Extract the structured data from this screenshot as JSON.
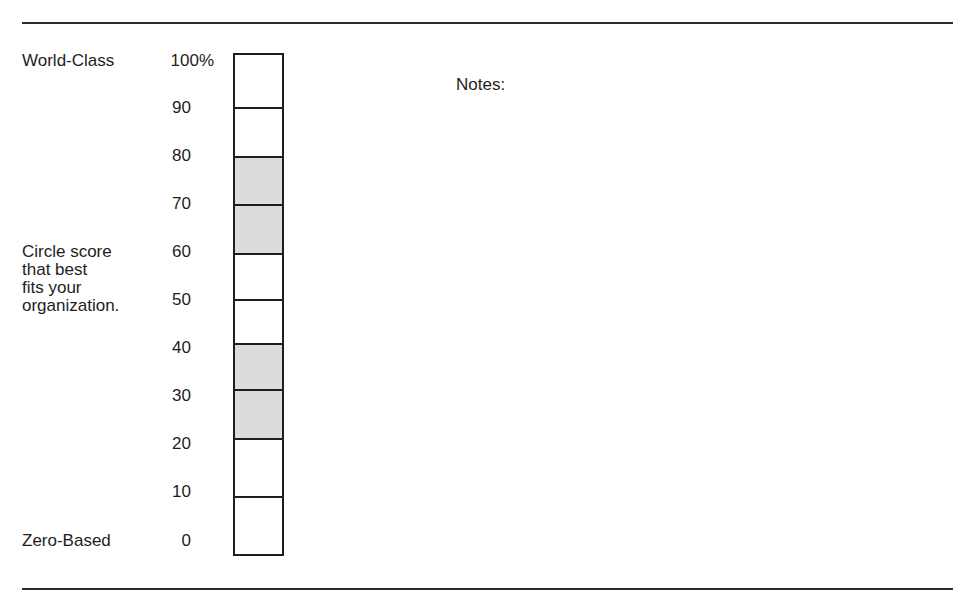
{
  "document": {
    "left_labels": {
      "top": "World-Class",
      "middle": [
        "Circle score",
        "that best",
        "fits your",
        "organization."
      ],
      "bottom": "Zero-Based"
    },
    "scale_ticks": [
      "100%",
      "90",
      "80",
      "70",
      "60",
      "50",
      "40",
      "30",
      "20",
      "10",
      "0"
    ],
    "segments": [
      {
        "range": "90-100",
        "shaded": false
      },
      {
        "range": "80-90",
        "shaded": false
      },
      {
        "range": "70-80",
        "shaded": true
      },
      {
        "range": "60-70",
        "shaded": true
      },
      {
        "range": "50-60",
        "shaded": false
      },
      {
        "range": "40-50",
        "shaded": false
      },
      {
        "range": "30-40",
        "shaded": true
      },
      {
        "range": "20-30",
        "shaded": true
      },
      {
        "range": "10-20",
        "shaded": false
      },
      {
        "range": "0-10",
        "shaded": false
      }
    ],
    "notes_label": "Notes:",
    "colors": {
      "line": "#1e1e1e",
      "shade": "#dcdcdc",
      "background": "#ffffff"
    }
  }
}
